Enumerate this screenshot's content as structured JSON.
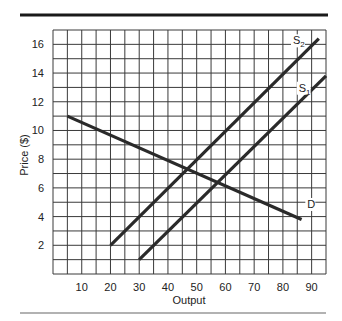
{
  "chart_data": {
    "type": "line",
    "title": "",
    "xlabel": "Output",
    "ylabel": "Price ($)",
    "xlim": [
      0,
      95
    ],
    "ylim": [
      0,
      17
    ],
    "grid": true,
    "grid_x_step": 5,
    "grid_y_step": 1,
    "x_ticks": [
      10,
      20,
      30,
      40,
      50,
      60,
      70,
      80,
      90
    ],
    "y_ticks": [
      2,
      4,
      6,
      8,
      10,
      12,
      14,
      16
    ],
    "legend": "none (inline line labels)",
    "series": [
      {
        "name": "D",
        "label_main": "D",
        "label_sub": "",
        "points": [
          [
            5,
            11
          ],
          [
            86.5,
            3.8
          ]
        ],
        "label_pos": [
          88.5,
          4.6
        ]
      },
      {
        "name": "S2",
        "label_main": "S",
        "label_sub": "2",
        "points": [
          [
            20,
            2
          ],
          [
            92.5,
            16.4
          ]
        ],
        "label_pos": [
          83.5,
          16.0
        ]
      },
      {
        "name": "S1",
        "label_main": "S",
        "label_sub": "1",
        "points": [
          [
            30,
            1
          ],
          [
            95,
            13.8
          ]
        ],
        "label_pos": [
          85.5,
          12.7
        ]
      }
    ]
  },
  "colors": {
    "line": "#2a2a2a",
    "grid": "#3a3a3a",
    "top_rule": "#1a1a1a",
    "bottom_rule": "#666666"
  }
}
